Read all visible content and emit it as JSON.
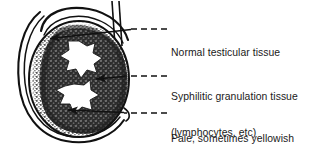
{
  "figure": {
    "background_color": "#ffffff",
    "ink_color": "#111111",
    "width": 328,
    "height": 150
  },
  "illustration": {
    "name": "testis-cross-section",
    "parts": [
      {
        "name": "scrotal-tunica-outline",
        "description": "outer curved line around testis"
      },
      {
        "name": "epididymis",
        "description": "curved structure arcing over the top of the testis"
      },
      {
        "name": "vas-deferens",
        "description": "two parallel vertical lines at upper right"
      },
      {
        "name": "testis-body",
        "description": "oval body of the testis"
      },
      {
        "name": "stippled-rim",
        "description": "light stippled normal testicular tissue at the periphery"
      },
      {
        "name": "dark-granular-zone",
        "description": "dense dark granulation tissue filling the centre"
      },
      {
        "name": "necrosis-patch-upper",
        "description": "irregular pale star-shaped area of necrosis, upper"
      },
      {
        "name": "necrosis-patch-lower",
        "description": "irregular pale star-shaped area of necrosis, lower"
      }
    ]
  },
  "labels": [
    {
      "id": "label-1",
      "name": "label-normal-testicular-tissue",
      "lines": [
        "Normal testicular tissue"
      ],
      "leader": {
        "dash_from_x": 131,
        "dash_to_x": 167,
        "dash_y": 29
      },
      "arrow": {
        "from_x": 131,
        "from_y": 29,
        "to_x": 46,
        "to_y": 39
      }
    },
    {
      "id": "label-2",
      "name": "label-syphilitic-granulation-tissue",
      "lines": [
        "Syphilitic granulation tissue",
        "(lymphocytes, etc)"
      ],
      "leader": {
        "dash_from_x": 122,
        "dash_to_x": 167,
        "dash_y": 76
      },
      "arrow": {
        "from_x": 122,
        "from_y": 76,
        "to_x": 92,
        "to_y": 79
      }
    },
    {
      "id": "label-3",
      "name": "label-area-of-necrosis",
      "lines": [
        "Pale, sometimes yellowish",
        "area of necrosis"
      ],
      "leader": {
        "dash_from_x": 122,
        "dash_to_x": 167,
        "dash_y": 113
      },
      "arrow": {
        "from_x": 122,
        "from_y": 113,
        "to_x": 63,
        "to_y": 110
      }
    }
  ]
}
